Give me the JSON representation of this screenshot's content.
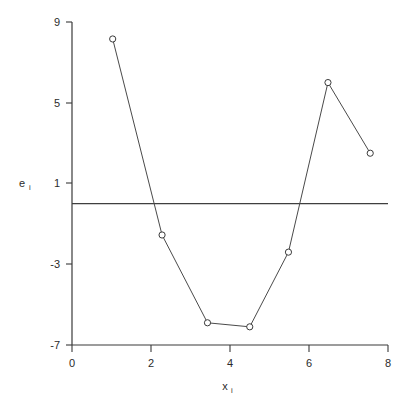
{
  "chart_data": {
    "type": "line",
    "title": "",
    "subtitle": "",
    "xlabel": "x",
    "xlabel_sub": "i",
    "ylabel": "e",
    "ylabel_sub": "i",
    "xlim": [
      0,
      8
    ],
    "ylim": [
      -7,
      9
    ],
    "xticks": [
      0,
      2,
      4,
      6,
      8
    ],
    "xtick_labels": [
      "0",
      "2",
      "4",
      "6",
      "8"
    ],
    "yticks": [
      9,
      5,
      1,
      -3,
      -7
    ],
    "ytick_labels": [
      "9",
      "5",
      "1",
      "-3",
      "-7"
    ],
    "grid": false,
    "legend": null,
    "marker": "open-circle",
    "series": [
      {
        "name": "residuals",
        "x": [
          1.03,
          2.28,
          3.43,
          4.5,
          5.48,
          6.48,
          7.55
        ],
        "values": [
          8.16,
          -1.55,
          -5.9,
          -6.1,
          -2.4,
          6.0,
          2.5
        ]
      }
    ],
    "reference_line": {
      "name": "zero-reference-line",
      "orientation": "horizontal",
      "y": 0.0,
      "x_start": 0.0,
      "x_end": 8.0
    },
    "annotations": []
  },
  "axes": {
    "y_axis_name": "vertical-axis",
    "x_axis_name": "horizontal-axis"
  }
}
